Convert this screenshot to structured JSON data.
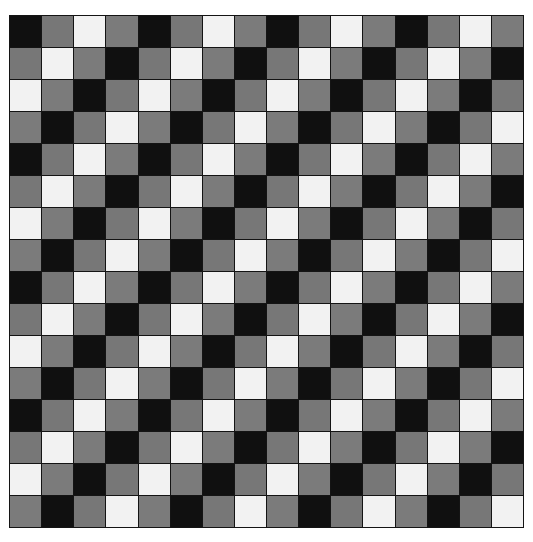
{
  "header": {
    "clipped_text": ""
  },
  "figure": {
    "title": "",
    "caption": "",
    "x": 9,
    "y": 15,
    "width": 515,
    "height": 513
  },
  "chart_data": {
    "type": "heatmap",
    "title": "",
    "subtitle": "",
    "xlabel": "",
    "ylabel": "",
    "rows": 16,
    "cols": 16,
    "cell_width_px": 32.2,
    "cell_height_px": 32.1,
    "grid": true,
    "gridline_color": "#141414",
    "gridline_width_px": 1,
    "legend_position": "none",
    "tone_levels": [
      0,
      1,
      2,
      3
    ],
    "tone_labels": [
      "black",
      "gray",
      "white",
      "gray"
    ],
    "palette": {
      "0": "#101010",
      "1": "#777777",
      "2": "#f2f2f2",
      "3": "#7b7b7b"
    },
    "palette_hex_list": [
      "#101010",
      "#777777",
      "#f2f2f2",
      "#7b7b7b"
    ],
    "period": 4,
    "formula": "(row + col) % 4",
    "values": [
      [
        0,
        1,
        2,
        3,
        0,
        1,
        2,
        3,
        0,
        1,
        2,
        3,
        0,
        1,
        2,
        3
      ],
      [
        1,
        2,
        3,
        0,
        1,
        2,
        3,
        0,
        1,
        2,
        3,
        0,
        1,
        2,
        3,
        0
      ],
      [
        2,
        3,
        0,
        1,
        2,
        3,
        0,
        1,
        2,
        3,
        0,
        1,
        2,
        3,
        0,
        1
      ],
      [
        3,
        0,
        1,
        2,
        3,
        0,
        1,
        2,
        3,
        0,
        1,
        2,
        3,
        0,
        1,
        2
      ],
      [
        0,
        1,
        2,
        3,
        0,
        1,
        2,
        3,
        0,
        1,
        2,
        3,
        0,
        1,
        2,
        3
      ],
      [
        1,
        2,
        3,
        0,
        1,
        2,
        3,
        0,
        1,
        2,
        3,
        0,
        1,
        2,
        3,
        0
      ],
      [
        2,
        3,
        0,
        1,
        2,
        3,
        0,
        1,
        2,
        3,
        0,
        1,
        2,
        3,
        0,
        1
      ],
      [
        3,
        0,
        1,
        2,
        3,
        0,
        1,
        2,
        3,
        0,
        1,
        2,
        3,
        0,
        1,
        2
      ],
      [
        0,
        1,
        2,
        3,
        0,
        1,
        2,
        3,
        0,
        1,
        2,
        3,
        0,
        1,
        2,
        3
      ],
      [
        1,
        2,
        3,
        0,
        1,
        2,
        3,
        0,
        1,
        2,
        3,
        0,
        1,
        2,
        3,
        0
      ],
      [
        2,
        3,
        0,
        1,
        2,
        3,
        0,
        1,
        2,
        3,
        0,
        1,
        2,
        3,
        0,
        1
      ],
      [
        3,
        0,
        1,
        2,
        3,
        0,
        1,
        2,
        3,
        0,
        1,
        2,
        3,
        0,
        1,
        2
      ],
      [
        0,
        1,
        2,
        3,
        0,
        1,
        2,
        3,
        0,
        1,
        2,
        3,
        0,
        1,
        2,
        3
      ],
      [
        1,
        2,
        3,
        0,
        1,
        2,
        3,
        0,
        1,
        2,
        3,
        0,
        1,
        2,
        3,
        0
      ],
      [
        2,
        3,
        0,
        1,
        2,
        3,
        0,
        1,
        2,
        3,
        0,
        1,
        2,
        3,
        0,
        1
      ],
      [
        3,
        0,
        1,
        2,
        3,
        0,
        1,
        2,
        3,
        0,
        1,
        2,
        3,
        0,
        1,
        2
      ]
    ]
  }
}
